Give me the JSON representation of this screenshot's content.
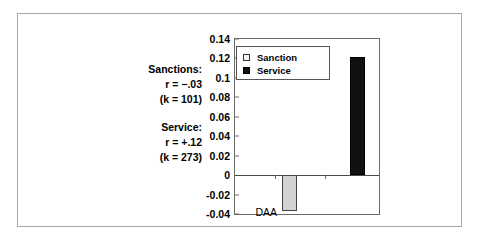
{
  "chart_data": {
    "type": "bar",
    "title": "",
    "xlabel": "",
    "ylabel": "",
    "categories": [
      "DAA"
    ],
    "series": [
      {
        "name": "Sanction",
        "values": [
          -0.037
        ],
        "color": "#d2d2d2"
      },
      {
        "name": "Service",
        "values": [
          0.121
        ],
        "color": "#111111"
      }
    ],
    "ylim": [
      -0.04,
      0.14
    ],
    "ytick_labels": [
      "0.14",
      "0.12",
      "0.1",
      "0.08",
      "0.06",
      "0.04",
      "0.02",
      "0",
      "-0.02",
      "-0.04"
    ],
    "ytick_values": [
      0.14,
      0.12,
      0.1,
      0.08,
      0.06,
      0.04,
      0.02,
      0,
      -0.02,
      -0.04
    ],
    "grid": false,
    "legend_position": "top-left",
    "zero_baseline": true
  },
  "legend": {
    "items": [
      {
        "label": "Sanction",
        "swatch": "open-square-swatch"
      },
      {
        "label": "Service",
        "swatch": "filled-square-swatch"
      }
    ]
  },
  "annotations": {
    "lines": [
      {
        "text": "Sanctions:",
        "style": "bold"
      },
      {
        "text": "r = −.03",
        "style": "bold-italic-r"
      },
      {
        "text": "(k = 101)",
        "style": "bold"
      },
      {
        "text": "",
        "style": "gap"
      },
      {
        "text": "Service:",
        "style": "bold"
      },
      {
        "text": "r = +.12",
        "style": "bold-italic-r"
      },
      {
        "text": "(k = 273)",
        "style": "bold"
      }
    ],
    "sanctions_label": "Sanctions:",
    "sanctions_r": "r = −.03",
    "sanctions_k": "(k = 101)",
    "service_label": "Service:",
    "service_r": "r = +.12",
    "service_k": "(k = 273)"
  },
  "axis": {
    "category_label": "DAA"
  },
  "colors": {
    "sanction_bar": "#d2d2d2",
    "service_bar": "#111111",
    "frame": "#a9a9a9",
    "plot_border": "#6b6b6b"
  }
}
